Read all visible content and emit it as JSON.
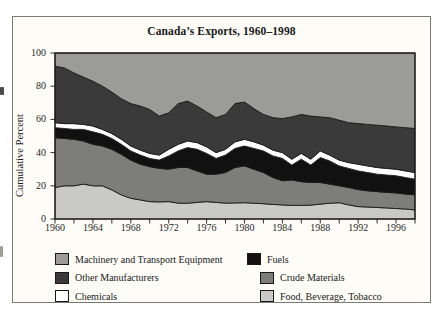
{
  "figure": {
    "title": "Canada’s Exports, 1960–1998",
    "y_axis_label": "Cumulative Percent"
  },
  "colors": {
    "outline": "#1a1a1a",
    "frame_border": "#7a7a78",
    "figure_background": "#fdfcf7"
  },
  "chart_data": {
    "type": "area",
    "stacked": true,
    "title": "Canada’s Exports, 1960–1998",
    "xlabel": "",
    "ylabel": "Cumulative Percent",
    "x_range": [
      1960,
      1998
    ],
    "ylim": [
      0,
      100
    ],
    "grid": false,
    "legend_position": "below",
    "y_tick_values": [
      0,
      20,
      40,
      60,
      80,
      100
    ],
    "x_tick_label_values": [
      1960,
      1964,
      1968,
      1972,
      1976,
      1980,
      1984,
      1988,
      1992,
      1996
    ],
    "x_minor_tick_step": 2,
    "years": [
      1960,
      1961,
      1962,
      1963,
      1964,
      1965,
      1966,
      1967,
      1968,
      1969,
      1970,
      1971,
      1972,
      1973,
      1974,
      1975,
      1976,
      1977,
      1978,
      1979,
      1980,
      1981,
      1982,
      1983,
      1984,
      1985,
      1986,
      1987,
      1988,
      1989,
      1990,
      1991,
      1992,
      1993,
      1994,
      1995,
      1996,
      1997,
      1998
    ],
    "series": [
      {
        "name": "Food, Beverage, Tobacco",
        "color": "#c9c9c7",
        "values": [
          19,
          20,
          20,
          21,
          20,
          20,
          17.5,
          14.5,
          12.5,
          11.5,
          10.5,
          10.3,
          10.5,
          9.6,
          9.5,
          10,
          10.5,
          10,
          9.6,
          9.7,
          9.8,
          9.5,
          9.2,
          8.8,
          8.5,
          8.2,
          8.2,
          8.4,
          9,
          9.5,
          9.8,
          8.5,
          7.5,
          7.2,
          6.9,
          6.7,
          6.3,
          6,
          5.5
        ]
      },
      {
        "name": "Crude Materials",
        "color": "#7d7d7b",
        "values": [
          30,
          28.5,
          28,
          26,
          25,
          24,
          24.5,
          24.5,
          23,
          21.5,
          21,
          20.2,
          19.5,
          21.4,
          21.5,
          19,
          16.5,
          17,
          18.4,
          21.3,
          22.2,
          20.5,
          18.8,
          16.2,
          14.5,
          15.3,
          14.3,
          13.6,
          13,
          11.5,
          10.2,
          10.5,
          10.2,
          9.8,
          9.6,
          9.3,
          9.4,
          9,
          9.1
        ]
      },
      {
        "name": "Fuels",
        "color": "#111111",
        "values": [
          6,
          6,
          6,
          7,
          7.5,
          7,
          6.5,
          6,
          5.5,
          5.5,
          5,
          5,
          8,
          10,
          12,
          13,
          12.5,
          9.5,
          10.5,
          11.5,
          12,
          12.5,
          13,
          13,
          13.5,
          9,
          13.5,
          10.5,
          15,
          14,
          12,
          11.5,
          11.3,
          11,
          10.5,
          10.5,
          10.3,
          10,
          9.4
        ]
      },
      {
        "name": "Chemicals",
        "color": "#ffffff",
        "values": [
          3,
          3,
          3.5,
          3,
          3.5,
          3,
          3,
          3,
          3,
          3,
          3,
          3,
          4,
          4,
          4,
          4,
          4,
          3.5,
          3.5,
          4,
          4,
          4,
          3.5,
          3.5,
          3.5,
          3.5,
          3.5,
          3.5,
          4,
          3.5,
          3.5,
          3.5,
          4,
          4,
          4,
          4,
          4,
          4,
          4
        ]
      },
      {
        "name": "Other Manufacturers",
        "color": "#3a3a3a",
        "values": [
          34,
          33.5,
          30.5,
          28.5,
          27,
          26,
          25,
          24.5,
          25.5,
          26.5,
          26.5,
          23.5,
          22,
          24.5,
          24,
          22,
          21,
          21,
          21,
          23,
          22.5,
          20,
          18.5,
          19.5,
          20.5,
          25.5,
          23.5,
          26,
          20.5,
          22.5,
          24,
          24,
          24.5,
          25,
          25.5,
          25.5,
          25.5,
          26,
          26.5
        ]
      },
      {
        "name": "Machinery and Transport Equipment",
        "color": "#9b9b99",
        "values": [
          8,
          9,
          12,
          14.5,
          17,
          20,
          23.5,
          27.5,
          30.5,
          32,
          34,
          38,
          36,
          30.5,
          29,
          32,
          35.5,
          39,
          37,
          30.5,
          29.5,
          33.5,
          37,
          39,
          39.5,
          38.5,
          37,
          38,
          38.5,
          39,
          40.5,
          42,
          42.5,
          43,
          43.5,
          44,
          44.5,
          45,
          45.5
        ]
      }
    ]
  },
  "legend": {
    "items": [
      {
        "label": "Machinery and Transport Equipment",
        "color": "#9b9b99"
      },
      {
        "label": "Fuels",
        "color": "#111111"
      },
      {
        "label": "Other Manufacturers",
        "color": "#3a3a3a"
      },
      {
        "label": "Crude Materials",
        "color": "#7d7d7b"
      },
      {
        "label": "Chemicals",
        "color": "#ffffff"
      },
      {
        "label": "Food, Beverage, Tobacco",
        "color": "#c9c9c7"
      }
    ]
  }
}
